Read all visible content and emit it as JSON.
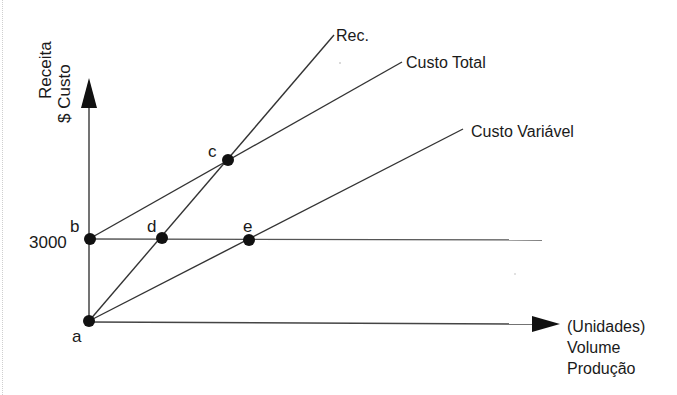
{
  "diagram": {
    "type": "break-even-chart",
    "y_axis_label": [
      "Receita",
      "$ Custo"
    ],
    "x_axis_label": [
      "(Unidades)",
      "Volume",
      "Produção"
    ],
    "y_tick_label": "3000",
    "lines": [
      {
        "name": "Rec.",
        "label": "Rec."
      },
      {
        "name": "Custo Total",
        "label": "Custo Total"
      },
      {
        "name": "Custo Variável",
        "label": "Custo Variável"
      }
    ],
    "points": {
      "a": "a",
      "b": "b",
      "c": "c",
      "d": "d",
      "e": "e"
    },
    "colors": {
      "line": "#3a3a3a",
      "point": "#111111",
      "text": "#1a1a1a"
    }
  }
}
